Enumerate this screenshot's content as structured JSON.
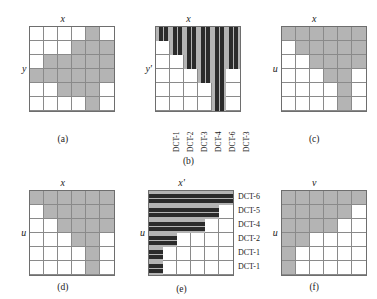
{
  "figure": {
    "grid_size": 6,
    "colors": {
      "shaded_cell": "#b4b4b4",
      "bar_dark": "#2b2b2b",
      "grid_line": "#8a8a8a",
      "border": "#6e6e6e",
      "background": "#ffffff"
    }
  },
  "panels": [
    {
      "id": "a",
      "caption": "(a)",
      "x_axis_label": "x",
      "y_axis_label": "y",
      "kind": "cells"
    },
    {
      "id": "b",
      "caption": "(b)",
      "x_axis_label": "x",
      "y_axis_label": "y'",
      "kind": "vertical-bars",
      "tick_labels": [
        "DCT-1",
        "DCT-2",
        "DCT-3",
        "DCT-4",
        "DCT-6",
        "DCT-3"
      ]
    },
    {
      "id": "c",
      "caption": "(c)",
      "x_axis_label": "x",
      "y_axis_label": "u",
      "kind": "cells"
    },
    {
      "id": "d",
      "caption": "(d)",
      "x_axis_label": "x",
      "y_axis_label": "u",
      "kind": "cells"
    },
    {
      "id": "e",
      "caption": "(e)",
      "x_axis_label": "x'",
      "y_axis_label": "u",
      "kind": "horizontal-bars",
      "tick_labels": [
        "DCT-6",
        "DCT-5",
        "DCT-4",
        "DCT-2",
        "DCT-1",
        "DCT-1"
      ]
    },
    {
      "id": "f",
      "caption": "(f)",
      "x_axis_label": "v",
      "y_axis_label": "u",
      "kind": "cells"
    }
  ],
  "chart_data": {
    "type": "heatmap",
    "title": "",
    "panel_a": {
      "type": "heatmap",
      "xlabel": "x",
      "ylabel": "y",
      "rows": [
        [
          0,
          0,
          0,
          0,
          1,
          0
        ],
        [
          0,
          0,
          0,
          1,
          1,
          1
        ],
        [
          0,
          1,
          1,
          1,
          1,
          1
        ],
        [
          1,
          1,
          1,
          1,
          1,
          1
        ],
        [
          0,
          0,
          1,
          1,
          1,
          0
        ],
        [
          0,
          0,
          0,
          0,
          1,
          0
        ]
      ]
    },
    "panel_b": {
      "type": "bar",
      "orientation": "vertical",
      "xlabel": "x",
      "ylabel": "y'",
      "categories": [
        "DCT-1",
        "DCT-2",
        "DCT-3",
        "DCT-4",
        "DCT-6",
        "DCT-3"
      ],
      "values": [
        1,
        2,
        3,
        4,
        6,
        3
      ],
      "ylim": [
        0,
        6
      ]
    },
    "panel_c": {
      "type": "heatmap",
      "xlabel": "x",
      "ylabel": "u",
      "rows": [
        [
          1,
          1,
          1,
          1,
          1,
          1
        ],
        [
          0,
          1,
          1,
          1,
          1,
          1
        ],
        [
          0,
          0,
          1,
          1,
          1,
          1
        ],
        [
          0,
          0,
          0,
          1,
          1,
          0
        ],
        [
          0,
          0,
          0,
          0,
          1,
          0
        ],
        [
          0,
          0,
          0,
          0,
          1,
          0
        ]
      ]
    },
    "panel_d": {
      "type": "heatmap",
      "xlabel": "x",
      "ylabel": "u",
      "rows": [
        [
          1,
          1,
          1,
          1,
          1,
          1
        ],
        [
          0,
          1,
          1,
          1,
          1,
          1
        ],
        [
          0,
          0,
          1,
          1,
          1,
          1
        ],
        [
          0,
          0,
          0,
          1,
          1,
          0
        ],
        [
          0,
          0,
          0,
          0,
          1,
          0
        ],
        [
          0,
          0,
          0,
          0,
          1,
          0
        ]
      ]
    },
    "panel_e": {
      "type": "bar",
      "orientation": "horizontal",
      "xlabel": "x'",
      "ylabel": "u",
      "categories": [
        "DCT-6",
        "DCT-5",
        "DCT-4",
        "DCT-2",
        "DCT-1",
        "DCT-1"
      ],
      "values": [
        6,
        5,
        4,
        2,
        1,
        1
      ],
      "xlim": [
        0,
        6
      ]
    },
    "panel_f": {
      "type": "heatmap",
      "xlabel": "v",
      "ylabel": "u",
      "rows": [
        [
          1,
          1,
          1,
          1,
          1,
          1
        ],
        [
          1,
          1,
          1,
          1,
          1,
          0
        ],
        [
          1,
          1,
          1,
          1,
          0,
          0
        ],
        [
          1,
          1,
          0,
          0,
          0,
          0
        ],
        [
          1,
          0,
          0,
          0,
          0,
          0
        ],
        [
          1,
          0,
          0,
          0,
          0,
          0
        ]
      ]
    }
  }
}
